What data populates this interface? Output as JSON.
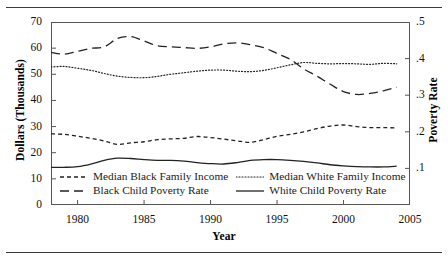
{
  "figure": {
    "rule_top": "horizontal-rule",
    "rule_bottom": "horizontal-rule"
  },
  "chart_data": {
    "type": "line",
    "title": "",
    "xlabel": "Year",
    "ylabel": "Dollars (Thousands)",
    "ylabel_right": "Poverty Rate",
    "xlim": [
      1978,
      2005
    ],
    "ylim": [
      0,
      70
    ],
    "ylim_right": [
      0.0,
      0.5
    ],
    "xticks": [
      1980,
      1985,
      1990,
      1995,
      2000,
      2005
    ],
    "xticklabels": [
      "1980",
      "1985",
      "1990",
      "1995",
      "2000",
      "2005"
    ],
    "yticks": [
      0,
      10,
      20,
      30,
      40,
      50,
      60,
      70
    ],
    "yticklabels": [
      "0",
      "10",
      "20",
      "30",
      "40",
      "50",
      "60",
      "70"
    ],
    "yticks_right": [
      0.1,
      0.2,
      0.3,
      0.4,
      0.5
    ],
    "yticklabels_right": [
      ".1",
      ".2",
      ".3",
      ".4",
      ".5"
    ],
    "grid": false,
    "legend_position": "inside-bottom",
    "x": [
      1978,
      1979,
      1980,
      1981,
      1982,
      1983,
      1984,
      1985,
      1986,
      1987,
      1988,
      1989,
      1990,
      1991,
      1992,
      1993,
      1994,
      1995,
      1996,
      1997,
      1998,
      1999,
      2000,
      2001,
      2002,
      2003,
      2004
    ],
    "series": [
      {
        "name": "Median White Family Income",
        "axis": "left",
        "style": "dotted",
        "units": "thousands of dollars",
        "values": [
          52.8,
          53.0,
          52.3,
          51.5,
          50.3,
          49.3,
          48.8,
          48.7,
          49.2,
          50.0,
          50.6,
          51.2,
          51.6,
          51.6,
          51.2,
          51.0,
          51.5,
          52.5,
          53.6,
          54.5,
          54.2,
          54.0,
          54.1,
          54.0,
          53.8,
          54.2,
          54.0
        ]
      },
      {
        "name": "Black Child Poverty Rate",
        "axis": "right",
        "style": "dashed-long",
        "units": "rate",
        "values": [
          0.417,
          0.412,
          0.42,
          0.428,
          0.432,
          0.455,
          0.46,
          0.448,
          0.435,
          0.432,
          0.43,
          0.428,
          0.432,
          0.44,
          0.443,
          0.438,
          0.43,
          0.414,
          0.398,
          0.372,
          0.352,
          0.33,
          0.31,
          0.302,
          0.305,
          0.312,
          0.322
        ]
      },
      {
        "name": "Median Black Family Income",
        "axis": "left",
        "style": "dashed-short",
        "units": "thousands of dollars",
        "values": [
          27.2,
          27.0,
          26.3,
          25.5,
          24.5,
          23.2,
          23.8,
          24.2,
          25.0,
          25.3,
          25.5,
          26.2,
          25.8,
          25.2,
          24.5,
          24.0,
          25.0,
          26.3,
          27.0,
          28.0,
          29.2,
          30.2,
          30.6,
          30.0,
          29.6,
          29.6,
          29.5
        ]
      },
      {
        "name": "White Child Poverty Rate",
        "axis": "right",
        "style": "solid",
        "units": "rate",
        "values": [
          0.103,
          0.103,
          0.105,
          0.112,
          0.122,
          0.128,
          0.127,
          0.124,
          0.122,
          0.122,
          0.12,
          0.116,
          0.113,
          0.112,
          0.116,
          0.122,
          0.124,
          0.124,
          0.122,
          0.119,
          0.115,
          0.11,
          0.107,
          0.105,
          0.104,
          0.104,
          0.106
        ]
      }
    ],
    "legend": [
      {
        "label": "Median Black Family Income",
        "style": "dashed-short"
      },
      {
        "label": "Median White Family Income",
        "style": "dotted"
      },
      {
        "label": "Black Child Poverty Rate",
        "style": "dashed-long"
      },
      {
        "label": "White Child Poverty Rate",
        "style": "solid"
      }
    ]
  }
}
